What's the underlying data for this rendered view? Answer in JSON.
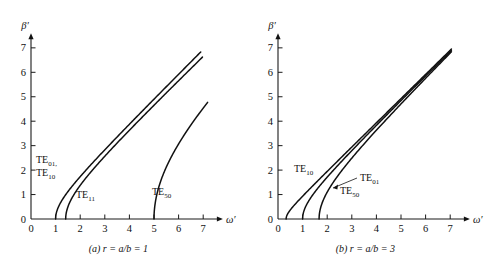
{
  "figure": {
    "background": "#ffffff",
    "ink": "#111111",
    "axis_title_x": "ω′",
    "axis_title_y": "β′"
  },
  "panels": [
    {
      "id": "a",
      "caption_prefix": "(a)",
      "caption_body": "r = a/b = 1",
      "caption_full": "(a) r = a/b = 1",
      "origin_px": {
        "x": 31,
        "y": 219
      },
      "unit_px": {
        "x": 24.6,
        "y": 24.45
      },
      "mode_labels": [
        {
          "name": "TE01",
          "base": "TE",
          "sub": "01,",
          "x_px": 36,
          "y_px": 163
        },
        {
          "name": "TE10",
          "base": "TE",
          "sub": "10",
          "x_px": 36,
          "y_px": 176
        },
        {
          "name": "TE11",
          "base": "TE",
          "sub": "11",
          "x_px": 76,
          "y_px": 198
        },
        {
          "name": "TE50",
          "base": "TE",
          "sub": "50",
          "x_px": 152,
          "y_px": 195
        }
      ],
      "curves": [
        {
          "name": "TE01-TE10",
          "cutoff": 1.0,
          "x_end": 6.9,
          "y_end": 6.83
        },
        {
          "name": "TE11",
          "cutoff": 1.41,
          "x_end": 6.97,
          "y_end": 6.62
        },
        {
          "name": "TE50",
          "cutoff": 5.0,
          "x_end": 7.18,
          "y_end": 4.77
        }
      ]
    },
    {
      "id": "b",
      "caption_prefix": "(b)",
      "caption_body": "r = a/b = 3",
      "caption_full": "(b) r = a/b = 3",
      "origin_px": {
        "x": 278,
        "y": 219
      },
      "unit_px": {
        "x": 24.6,
        "y": 24.45
      },
      "mode_labels": [
        {
          "name": "TE10",
          "base": "TE",
          "sub": "10",
          "x_px": 294,
          "y_px": 172
        },
        {
          "name": "TE01",
          "base": "TE",
          "sub": "01",
          "x_px": 360,
          "y_px": 181
        },
        {
          "name": "TE50",
          "base": "TE",
          "sub": "50",
          "x_px": 340,
          "y_px": 194
        }
      ],
      "leader": {
        "name": "te01-leader",
        "x1": 357,
        "y1": 178,
        "x2": 333,
        "y2": 188
      },
      "curves": [
        {
          "name": "TE10",
          "cutoff": 0.33,
          "x_end": 7.05,
          "y_end": 6.95
        },
        {
          "name": "TE01",
          "cutoff": 1.0,
          "x_end": 7.05,
          "y_end": 6.9
        },
        {
          "name": "TE50",
          "cutoff": 1.67,
          "x_end": 7.05,
          "y_end": 6.84
        }
      ]
    }
  ],
  "axes": {
    "x_ticks": [
      0,
      1,
      2,
      3,
      4,
      5,
      6,
      7
    ],
    "y_ticks": [
      0,
      1,
      2,
      3,
      4,
      5,
      6,
      7
    ],
    "x_range": [
      0,
      7.8
    ],
    "y_range": [
      0,
      7.6
    ]
  },
  "chart_data": {
    "type": "line",
    "title": "",
    "xlabel": "ω′",
    "ylabel": "β′",
    "xlim": [
      0,
      7.8
    ],
    "ylim": [
      0,
      7.6
    ],
    "grid": false,
    "legend": "inline-labels",
    "x_ticks": [
      0,
      1,
      2,
      3,
      4,
      5,
      6,
      7
    ],
    "y_ticks": [
      0,
      1,
      2,
      3,
      4,
      5,
      6,
      7
    ],
    "subplots": [
      {
        "panel": "a",
        "caption": "(a) r = a/b = 1",
        "relation": "beta' = sqrt(omega'^2 - omega'_c^2)",
        "series": [
          {
            "name": "TE01, TE10",
            "cutoff": 1.0,
            "x": [
              1.0,
              1.2,
              1.5,
              2.0,
              2.5,
              3.0,
              3.5,
              4.0,
              4.5,
              5.0,
              5.5,
              6.0,
              6.5,
              6.9
            ],
            "values": [
              0.0,
              0.66,
              1.12,
              1.73,
              2.29,
              2.83,
              3.35,
              3.87,
              4.39,
              4.9,
              5.41,
              5.92,
              6.42,
              6.83
            ]
          },
          {
            "name": "TE11",
            "cutoff": 1.41,
            "x": [
              1.41,
              1.6,
              2.0,
              2.5,
              3.0,
              3.5,
              4.0,
              4.5,
              5.0,
              5.5,
              6.0,
              6.5,
              6.97
            ],
            "values": [
              0.0,
              0.75,
              1.41,
              2.06,
              2.64,
              3.2,
              3.74,
              4.27,
              4.8,
              5.32,
              5.83,
              6.35,
              6.62
            ]
          },
          {
            "name": "TE50",
            "cutoff": 5.0,
            "x": [
              5.0,
              5.2,
              5.5,
              6.0,
              6.5,
              7.0,
              7.18
            ],
            "values": [
              0.0,
              1.43,
              2.29,
              3.32,
              4.15,
              4.9,
              4.77
            ]
          }
        ]
      },
      {
        "panel": "b",
        "caption": "(b) r = a/b = 3",
        "relation": "beta' = sqrt(omega'^2 - omega'_c^2)",
        "series": [
          {
            "name": "TE10",
            "cutoff": 0.33,
            "x": [
              0.33,
              0.5,
              1.0,
              1.5,
              2.0,
              3.0,
              4.0,
              5.0,
              6.0,
              7.05
            ],
            "values": [
              0.0,
              0.37,
              0.94,
              1.46,
              1.97,
              2.98,
              3.99,
              4.99,
              5.99,
              6.95
            ]
          },
          {
            "name": "TE01",
            "cutoff": 1.0,
            "x": [
              1.0,
              1.2,
              1.5,
              2.0,
              3.0,
              4.0,
              5.0,
              6.0,
              7.05
            ],
            "values": [
              0.0,
              0.66,
              1.12,
              1.73,
              2.83,
              3.87,
              4.9,
              5.92,
              6.9
            ]
          },
          {
            "name": "TE50",
            "cutoff": 1.67,
            "x": [
              1.67,
              1.9,
              2.2,
              2.6,
              3.0,
              4.0,
              5.0,
              6.0,
              7.05
            ],
            "values": [
              0.0,
              0.91,
              1.43,
              1.99,
              2.49,
              3.63,
              4.71,
              5.76,
              6.84
            ]
          }
        ]
      }
    ]
  }
}
